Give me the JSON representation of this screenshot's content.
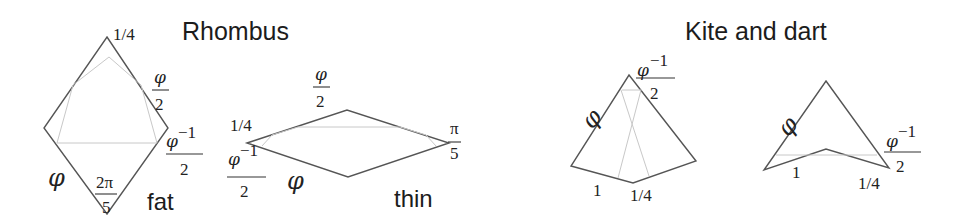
{
  "titles": {
    "rhombus": "Rhombus",
    "kite_dart": "Kite and dart"
  },
  "fat": {
    "label": "fat",
    "top_label": "1/4",
    "side_label_num": "φ",
    "side_label_den": "2",
    "right_label_num": "φ",
    "right_label_exp": "−1",
    "right_label_den": "2",
    "edge_label": "φ",
    "angle_num": "2π",
    "angle_den": "5"
  },
  "thin": {
    "label": "thin",
    "top_num": "φ",
    "top_den": "2",
    "left_label": "1/4",
    "left_frac_num": "φ",
    "left_frac_exp": "−1",
    "left_frac_den": "2",
    "edge_label": "φ",
    "angle_num": "π",
    "angle_den": "5"
  },
  "kite": {
    "top_num": "φ",
    "top_exp": "−1",
    "top_den": "2",
    "edge_label": "φ",
    "bottom_left": "1",
    "bottom_right": "1/4"
  },
  "dart": {
    "edge_label": "φ",
    "right_num": "φ",
    "right_exp": "−1",
    "right_den": "2",
    "bottom_left": "1",
    "bottom_right": "1/4"
  },
  "colors": {
    "outline": "#555555",
    "inner": "#c8c8c8",
    "text": "#1c1c1c"
  }
}
